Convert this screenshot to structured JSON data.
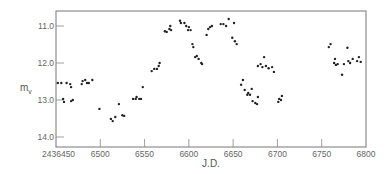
{
  "chart_data": {
    "type": "scatter",
    "title": "",
    "xlabel": "J.D.",
    "ylabel": "m",
    "ylabel_subscript": "v",
    "xlim": [
      6450,
      6800
    ],
    "ylim": [
      14.2,
      10.6
    ],
    "y_inverted": true,
    "grid": false,
    "legend": "none",
    "x_ticks": [
      6450,
      6500,
      6550,
      6600,
      6650,
      6700,
      6750,
      6800
    ],
    "x_tick_labels": [
      "2436450",
      "6500",
      "6550",
      "6600",
      "6650",
      "6700",
      "6750",
      "6800"
    ],
    "y_ticks": [
      11.0,
      12.0,
      13.0,
      14.0
    ],
    "y_tick_labels": [
      "11.0",
      "12.0",
      "13.0",
      "14.0"
    ],
    "series": [
      {
        "name": "observations",
        "x": [
          6452,
          6456,
          6462,
          6466,
          6467,
          6458,
          6459,
          6467,
          6469,
          6479,
          6480,
          6483,
          6485,
          6487,
          6491,
          6499,
          6512,
          6514,
          6517,
          6521,
          6525,
          6527,
          6537,
          6540,
          6541,
          6544,
          6546,
          6548,
          6558,
          6561,
          6564,
          6566,
          6567,
          6573,
          6575,
          6578,
          6579,
          6580,
          6590,
          6591,
          6595,
          6597,
          6599,
          6600,
          6602,
          6604,
          6605,
          6607,
          6609,
          6611,
          6614,
          6615,
          6620,
          6622,
          6624,
          6626,
          6636,
          6639,
          6642,
          6645,
          6651,
          6649,
          6652,
          6654,
          6659,
          6661,
          6663,
          6666,
          6667,
          6669,
          6671,
          6672,
          6675,
          6677,
          6678,
          6678,
          6681,
          6683,
          6685,
          6687,
          6690,
          6694,
          6696,
          6701,
          6702,
          6704,
          6705,
          6758,
          6760,
          6764,
          6765,
          6766,
          6768,
          6773,
          6775,
          6779,
          6780,
          6782,
          6785,
          6790,
          6792,
          6794
        ],
        "y": [
          12.54,
          12.54,
          12.54,
          12.57,
          12.65,
          12.97,
          13.05,
          13.03,
          13.0,
          12.57,
          12.49,
          12.46,
          12.54,
          12.54,
          12.46,
          13.24,
          13.51,
          13.57,
          13.46,
          13.11,
          13.41,
          13.43,
          12.97,
          12.97,
          12.92,
          12.97,
          12.97,
          12.65,
          12.22,
          12.16,
          12.16,
          12.08,
          12.0,
          11.14,
          11.16,
          11.08,
          11.0,
          11.11,
          10.86,
          10.92,
          10.92,
          11.0,
          11.11,
          11.03,
          11.11,
          11.49,
          11.57,
          11.84,
          11.81,
          11.89,
          12.0,
          12.03,
          11.24,
          11.08,
          11.03,
          11.0,
          10.95,
          10.95,
          11.0,
          10.81,
          10.92,
          11.32,
          11.41,
          11.49,
          12.59,
          12.46,
          12.73,
          12.86,
          12.81,
          12.86,
          12.7,
          13.03,
          13.08,
          13.11,
          12.92,
          12.08,
          12.03,
          12.11,
          11.84,
          12.08,
          12.14,
          12.11,
          12.24,
          13.05,
          12.97,
          13.0,
          12.89,
          11.57,
          11.49,
          12.0,
          11.89,
          12.05,
          12.03,
          12.32,
          12.03,
          11.59,
          11.95,
          12.0,
          11.89,
          11.95,
          11.84,
          11.97
        ]
      }
    ]
  }
}
